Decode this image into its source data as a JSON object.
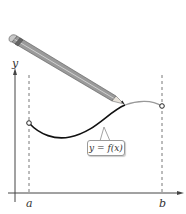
{
  "figure": {
    "axes": {
      "y_label": "y",
      "x_tick_labels": [
        "a",
        "b"
      ]
    },
    "function_label": "y = f(x)",
    "colors": {
      "curve_drawn": "#111111",
      "curve_undrawn": "#999999",
      "axis": "#444444",
      "dashed_guides": "#555555",
      "pencil_body": "#8a8a8a"
    }
  }
}
